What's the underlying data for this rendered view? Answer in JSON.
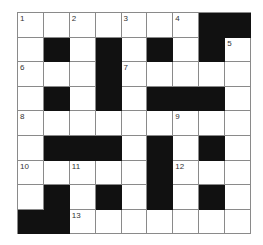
{
  "puzzle": {
    "rows": 9,
    "cols": 9,
    "colors": {
      "black": "#111111",
      "white": "#ffffff",
      "line": "#8a8a8a"
    },
    "grid": [
      [
        "1",
        "",
        "2",
        "",
        "3",
        "",
        "4",
        "#",
        "#"
      ],
      [
        "",
        "#",
        "",
        "#",
        "",
        "#",
        "",
        "#",
        "5"
      ],
      [
        "6",
        "",
        "",
        "#",
        "7",
        "",
        "",
        "",
        ""
      ],
      [
        "",
        "#",
        "",
        "#",
        "",
        "#",
        "#",
        "#",
        ""
      ],
      [
        "8",
        "",
        "",
        "",
        "",
        "",
        "9",
        "",
        ""
      ],
      [
        "",
        "#",
        "#",
        "#",
        "",
        "#",
        "",
        "#",
        ""
      ],
      [
        "10",
        "",
        "11",
        "",
        "",
        "#",
        "12",
        "",
        ""
      ],
      [
        "",
        "#",
        "",
        "#",
        "",
        "#",
        "",
        "#",
        ""
      ],
      [
        "#",
        "#",
        "13",
        "",
        "",
        "",
        "",
        "",
        ""
      ]
    ]
  }
}
